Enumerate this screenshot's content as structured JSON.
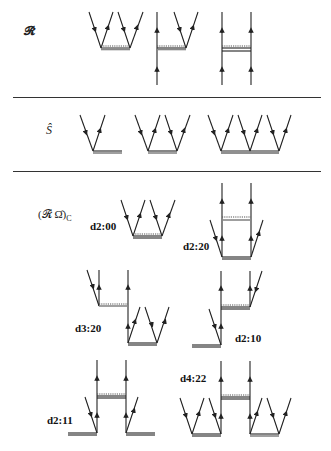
{
  "rows": {
    "r_operator": {
      "label": "𝓡̂"
    },
    "s_operator": {
      "label": "Ŝ"
    },
    "product": {
      "label_main": "(𝓡̂ Ω̂)",
      "label_sub": "C"
    }
  },
  "diagram_labels": {
    "d2_00": "d2:00",
    "d2_20": "d2:20",
    "d3_20": "d3:20",
    "d2_10": "d2:10",
    "d2_11": "d2:11",
    "d4_22": "d4:22"
  },
  "colors": {
    "line": "#222222",
    "separator": "#333333",
    "interaction_dashed": "#555555"
  }
}
